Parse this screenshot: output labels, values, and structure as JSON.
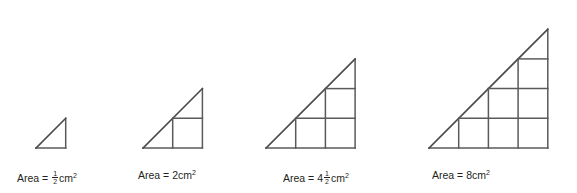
{
  "figure": {
    "title_alt": "Four similar right-angled triangles with unit-square grids showing areas",
    "line_color": "#5a5a5a",
    "text_color": "#231f20",
    "background": "#ffffff",
    "unit_cell_px": 29.7,
    "baseline_y": 148,
    "figures": [
      {
        "name": "triangle-1",
        "scale": 1,
        "origin_x": 36,
        "legs_units": 1,
        "area_value": "1/2",
        "area_display": "Area = ½ cm²",
        "label_prefix": "Area =",
        "label_whole": "",
        "label_fraction_num": "1",
        "label_fraction_den": "2",
        "label_unit": "cm",
        "label_exponent": "2",
        "label_x": 17,
        "full_squares": 0
      },
      {
        "name": "triangle-2",
        "scale": 2,
        "origin_x": 143,
        "legs_units": 2,
        "area_value": "2",
        "area_display": "Area = 2cm²",
        "label_prefix": "Area =",
        "label_whole": "2",
        "label_fraction_num": "",
        "label_fraction_den": "",
        "label_unit": "cm",
        "label_exponent": "2",
        "label_x": 138,
        "full_squares": 1
      },
      {
        "name": "triangle-3",
        "scale": 3,
        "origin_x": 266,
        "legs_units": 3,
        "area_value": "4 1/2",
        "area_display": "Area = 4½ cm²",
        "label_prefix": "Area =",
        "label_whole": "4",
        "label_fraction_num": "1",
        "label_fraction_den": "2",
        "label_unit": "cm",
        "label_exponent": "2",
        "label_x": 283,
        "full_squares": 3
      },
      {
        "name": "triangle-4",
        "scale": 4,
        "origin_x": 429,
        "legs_units": 4,
        "area_value": "8",
        "area_display": "Area = 8cm²",
        "label_prefix": "Area =",
        "label_whole": "8",
        "label_fraction_num": "",
        "label_fraction_den": "",
        "label_unit": "cm",
        "label_exponent": "2",
        "label_x": 432,
        "full_squares": 6
      }
    ]
  }
}
